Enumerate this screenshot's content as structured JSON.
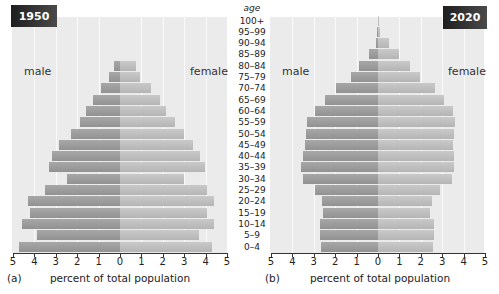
{
  "age_header": "age",
  "age_groups": [
    "100+",
    "95–99",
    "90–94",
    "85–89",
    "80–84",
    "75–79",
    "70–74",
    "65–69",
    "60–64",
    "55–59",
    "50–54",
    "45–49",
    "40–44",
    "35–39",
    "30–34",
    "25–29",
    "20–24",
    "15–19",
    "10–14",
    "5–9",
    "0–4"
  ],
  "tick_labels": [
    "5",
    "4",
    "3",
    "2",
    "1",
    "0",
    "1",
    "2",
    "3",
    "4",
    "5"
  ],
  "colors": {
    "male": "#9a9a9a",
    "female": "#bdbdbd",
    "panel_bg": "#ebebeb",
    "badge": "#2a2a2a"
  },
  "panels": [
    {
      "year": "1950",
      "caption": "(a)",
      "xlabel": "percent of total population",
      "male_label": "male",
      "female_label": "female"
    },
    {
      "year": "2020",
      "caption": "(b)",
      "xlabel": "percent of total population",
      "male_label": "male",
      "female_label": "female"
    }
  ],
  "chart_data": [
    {
      "type": "bar",
      "title": "1950",
      "subtitle": "(a)",
      "orientation": "horizontal population pyramid",
      "xlabel": "percent of total population",
      "ylabel": "age",
      "xlim": [
        -5,
        5
      ],
      "xticks": [
        5,
        4,
        3,
        2,
        1,
        0,
        1,
        2,
        3,
        4,
        5
      ],
      "grid": true,
      "categories": [
        "100+",
        "95–99",
        "90–94",
        "85–89",
        "80–84",
        "75–79",
        "70–74",
        "65–69",
        "60–64",
        "55–59",
        "50–54",
        "45–49",
        "40–44",
        "35–39",
        "30–34",
        "25–29",
        "20–24",
        "15–19",
        "10–14",
        "5–9",
        "0–4"
      ],
      "series": [
        {
          "name": "male",
          "values": [
            0,
            0,
            0,
            0,
            0.3,
            0.5,
            0.9,
            1.25,
            1.6,
            1.85,
            2.3,
            2.85,
            3.2,
            3.3,
            2.5,
            3.5,
            4.3,
            4.2,
            4.6,
            3.9,
            4.7
          ]
        },
        {
          "name": "female",
          "values": [
            0,
            0,
            0,
            0,
            0.75,
            0.95,
            1.45,
            1.85,
            2.15,
            2.55,
            3.0,
            3.4,
            3.75,
            3.95,
            3.0,
            4.05,
            4.4,
            4.05,
            4.4,
            3.7,
            4.3
          ]
        }
      ]
    },
    {
      "type": "bar",
      "title": "2020",
      "subtitle": "(b)",
      "orientation": "horizontal population pyramid",
      "xlabel": "percent of total population",
      "ylabel": "age",
      "xlim": [
        -5,
        5
      ],
      "xticks": [
        5,
        4,
        3,
        2,
        1,
        0,
        1,
        2,
        3,
        4,
        5
      ],
      "grid": true,
      "categories": [
        "100+",
        "95–99",
        "90–94",
        "85–89",
        "80–84",
        "75–79",
        "70–74",
        "65–69",
        "60–64",
        "55–59",
        "50–54",
        "45–49",
        "40–44",
        "35–39",
        "30–34",
        "25–29",
        "20–24",
        "15–19",
        "10–14",
        "5–9",
        "0–4"
      ],
      "series": [
        {
          "name": "male",
          "values": [
            0.01,
            0.05,
            0.1,
            0.4,
            0.9,
            1.25,
            1.95,
            2.5,
            2.95,
            3.3,
            3.35,
            3.4,
            3.5,
            3.6,
            3.5,
            2.95,
            2.6,
            2.55,
            2.7,
            2.7,
            2.65
          ]
        },
        {
          "name": "female",
          "values": [
            0.03,
            0.1,
            0.5,
            1.0,
            1.5,
            1.95,
            2.65,
            3.1,
            3.5,
            3.6,
            3.55,
            3.5,
            3.55,
            3.55,
            3.45,
            2.9,
            2.5,
            2.45,
            2.6,
            2.6,
            2.55
          ]
        }
      ]
    }
  ]
}
